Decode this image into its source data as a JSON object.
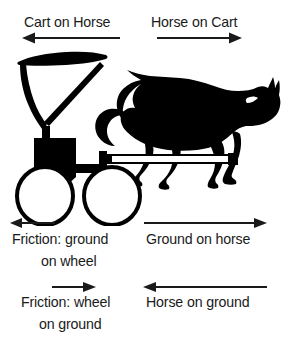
{
  "figure": {
    "background_color": "#ffffff",
    "ink_color": "#000000",
    "text_color": "#1a1a1a",
    "width": 288,
    "height": 349
  },
  "labels": {
    "top_left": "Cart on Horse",
    "top_right": "Horse on Cart",
    "mid_left_line1": "Friction: ground",
    "mid_left_line2": "on wheel",
    "mid_right": "Ground on horse",
    "bottom_left_line1": "Friction: wheel",
    "bottom_left_line2": "on ground",
    "bottom_right": "Horse on ground"
  },
  "arrows": [
    {
      "name": "cart-on-horse-arrow",
      "direction": "left",
      "label": "Cart on Horse",
      "x": 25,
      "y": 38,
      "length": 93
    },
    {
      "name": "horse-on-cart-arrow",
      "direction": "right",
      "label": "Horse on Cart",
      "x": 158,
      "y": 38,
      "length": 80
    },
    {
      "name": "friction-ground-on-wheel-arrow",
      "direction": "left",
      "label": "Friction: ground on wheel",
      "x": 12,
      "y": 223,
      "length": 40
    },
    {
      "name": "ground-on-horse-arrow",
      "direction": "right",
      "label": "Ground on horse",
      "x": 145,
      "y": 223,
      "length": 120
    },
    {
      "name": "friction-wheel-on-ground-arrow",
      "direction": "right",
      "label": "Friction: wheel on ground",
      "x": 54,
      "y": 287,
      "length": 38
    },
    {
      "name": "horse-on-ground-arrow",
      "direction": "left",
      "label": "Horse on ground",
      "x": 145,
      "y": 287,
      "length": 120
    }
  ],
  "illustration": {
    "cart": {
      "name": "cart-silhouette",
      "parts": [
        "canopy",
        "canopy-support",
        "diagonal-strut",
        "seat-body",
        "footboard",
        "front-wheel",
        "rear-wheel",
        "shaft"
      ]
    },
    "horse": {
      "name": "horse-silhouette",
      "parts": [
        "head",
        "mane",
        "ear",
        "neck",
        "body",
        "tail",
        "foreleg-front",
        "foreleg-rear",
        "hindleg-front",
        "hindleg-rear",
        "hoof"
      ]
    }
  }
}
